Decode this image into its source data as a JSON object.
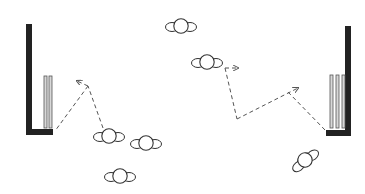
{
  "diagram": {
    "colors": {
      "background": "#ffffff",
      "backstop": "#222222",
      "stump_fill": "#d8d8d8",
      "stump_stroke": "#555555",
      "player_stroke": "#333333",
      "path_stroke": "#555555"
    },
    "wickets": [
      {
        "id": "left",
        "backstop": {
          "vertical": [
            26,
            24,
            6,
            111
          ],
          "base": [
            26,
            129,
            27,
            6
          ]
        },
        "stumps": [
          [
            44,
            76,
            3,
            52
          ],
          [
            49,
            76,
            3,
            52
          ]
        ]
      },
      {
        "id": "right",
        "backstop": {
          "vertical": [
            345,
            26,
            6,
            110
          ],
          "base": [
            326,
            130,
            25,
            6
          ]
        },
        "stumps": [
          [
            330,
            75,
            3,
            53
          ],
          [
            336,
            75,
            3,
            53
          ],
          [
            342,
            75,
            3,
            53
          ]
        ]
      }
    ],
    "players": [
      {
        "id": "fielder-1",
        "x": 181,
        "y": 26,
        "rotate": 0
      },
      {
        "id": "fielder-2",
        "x": 207,
        "y": 62,
        "rotate": 0
      },
      {
        "id": "fielder-3",
        "x": 109,
        "y": 136,
        "rotate": 0
      },
      {
        "id": "fielder-4",
        "x": 146,
        "y": 143,
        "rotate": 0
      },
      {
        "id": "fielder-5",
        "x": 120,
        "y": 176,
        "rotate": 0
      },
      {
        "id": "fielder-6",
        "x": 305,
        "y": 160,
        "rotate": -38
      }
    ],
    "paths": [
      {
        "id": "left-run-from-fielder",
        "points": [
          [
            103,
            128
          ],
          [
            88,
            86
          ]
        ],
        "arrow": false
      },
      {
        "id": "left-run-arrow",
        "points": [
          [
            88,
            86
          ],
          [
            77,
            81
          ]
        ],
        "arrow": true
      },
      {
        "id": "left-throw-to-wicket",
        "points": [
          [
            88,
            86
          ],
          [
            55,
            131
          ]
        ],
        "arrow": false
      },
      {
        "id": "right-start-arrow",
        "points": [
          [
            225,
            68
          ],
          [
            238,
            68
          ]
        ],
        "arrow": true
      },
      {
        "id": "right-run-down",
        "points": [
          [
            225,
            68
          ],
          [
            237,
            119
          ]
        ],
        "arrow": false
      },
      {
        "id": "right-run-across",
        "points": [
          [
            237,
            119
          ],
          [
            298,
            88
          ]
        ],
        "arrow": true
      },
      {
        "id": "right-throw-to-wicket",
        "points": [
          [
            288,
            92
          ],
          [
            325,
            130
          ]
        ],
        "arrow": false
      }
    ]
  }
}
